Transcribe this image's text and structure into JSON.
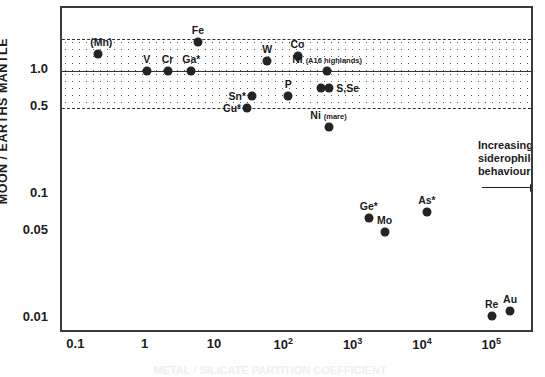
{
  "chart_data": {
    "type": "scatter",
    "title": "",
    "xlabel": "",
    "ylabel": "MOON / EARTHS MANTLE",
    "xscale": "log",
    "yscale": "log",
    "xlim": [
      0.06,
      400000
    ],
    "ylim": [
      0.0075,
      3.2
    ],
    "grid": false,
    "legend": null,
    "xtick_labels": [
      "0.1",
      "1",
      "10",
      "10²",
      "10³",
      "10⁴",
      "10⁵"
    ],
    "xtick_values": [
      0.1,
      1,
      10,
      100,
      1000,
      10000,
      100000
    ],
    "ytick_labels": [
      "1.0",
      "0.5",
      "0.1",
      "0.05",
      "0.01"
    ],
    "ytick_values": [
      1.0,
      0.5,
      0.1,
      0.05,
      0.01
    ],
    "bands": [
      {
        "name": "stipple-band",
        "y_top": 1.8,
        "y_bottom": 0.5,
        "line_at": 1.0,
        "top_style": "dashed",
        "mid_style": "solid",
        "bottom_style": "dashed"
      }
    ],
    "points": [
      {
        "label": "(Mn)",
        "display": "(Mn)",
        "x": 0.2,
        "y": 1.35,
        "label_pos": "above-left"
      },
      {
        "label": "V",
        "display": "V",
        "x": 1.0,
        "y": 1.0,
        "label_pos": "above"
      },
      {
        "label": "Cr",
        "display": "Cr",
        "x": 2.0,
        "y": 1.0,
        "label_pos": "above"
      },
      {
        "label": "Ga*",
        "display": "Ga*",
        "x": 4.4,
        "y": 1.0,
        "label_pos": "above"
      },
      {
        "label": "Fe",
        "display": "Fe",
        "x": 5.5,
        "y": 1.7,
        "label_pos": "above"
      },
      {
        "label": "Cu*",
        "display": "Cu*",
        "x": 28.0,
        "y": 0.5,
        "label_pos": "left"
      },
      {
        "label": "Sn*",
        "display": "Sn*",
        "x": 33.0,
        "y": 0.62,
        "label_pos": "left"
      },
      {
        "label": "W",
        "display": "W",
        "x": 55.0,
        "y": 1.2,
        "label_pos": "above"
      },
      {
        "label": "P",
        "display": "P",
        "x": 110.0,
        "y": 0.62,
        "label_pos": "above"
      },
      {
        "label": "Co",
        "display": "Co",
        "x": 150.0,
        "y": 1.3,
        "label_pos": "above"
      },
      {
        "label": "S",
        "display": "",
        "x": 330.0,
        "y": 0.72,
        "label_pos": "none"
      },
      {
        "label": "S,Se",
        "display": "S,Se",
        "x": 430.0,
        "y": 0.72,
        "label_pos": "right"
      },
      {
        "label": "Ni (A16 highlands)",
        "display": "Ni",
        "sublabel": "(A16 highlands)",
        "x": 400.0,
        "y": 1.0,
        "label_pos": "above"
      },
      {
        "label": "Ni (mare)",
        "display": "Ni",
        "sublabel": "(mare)",
        "x": 420.0,
        "y": 0.35,
        "label_pos": "above"
      },
      {
        "label": "Ge*",
        "display": "Ge*",
        "x": 1600.0,
        "y": 0.065,
        "label_pos": "above"
      },
      {
        "label": "Mo",
        "display": "Mo",
        "x": 2700.0,
        "y": 0.05,
        "label_pos": "above"
      },
      {
        "label": "As*",
        "display": "As*",
        "x": 11000.0,
        "y": 0.072,
        "label_pos": "above"
      },
      {
        "label": "Re",
        "display": "Re",
        "x": 95000.0,
        "y": 0.0105,
        "label_pos": "above"
      },
      {
        "label": "Au",
        "display": "Au",
        "x": 175000.0,
        "y": 0.0115,
        "label_pos": "above"
      }
    ],
    "annotations": [
      {
        "name": "increasing-siderophile-behaviour",
        "lines": [
          "Increasing",
          "siderophile",
          "behaviour"
        ],
        "arrow": "right"
      }
    ]
  },
  "axes": {
    "y_title": "MOON / EARTHS MANTLE",
    "x_title": "METAL / SILICATE PARTITION COEFFICIENT"
  }
}
